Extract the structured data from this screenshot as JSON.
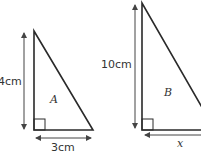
{
  "figure": {
    "triangle_a": {
      "name": "A",
      "height_label": "4cm",
      "base_label": "3cm"
    },
    "triangle_b": {
      "name": "B",
      "height_label": "10cm",
      "base_label": "x"
    },
    "colors": {
      "line": "#2a2a2a",
      "arrow": "#444444",
      "text": "#333333"
    }
  }
}
